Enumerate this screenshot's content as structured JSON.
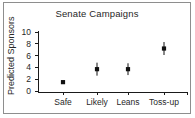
{
  "chart_data": {
    "type": "scatter",
    "title": "Senate Campaigns",
    "xlabel": "",
    "ylabel": "Predicted Sponsors",
    "categories": [
      "Safe",
      "Likely",
      "Leans",
      "Toss-up"
    ],
    "values": [
      1.5,
      3.7,
      3.7,
      7.2
    ],
    "error_low": [
      1.5,
      2.6,
      2.7,
      6.1
    ],
    "error_high": [
      1.5,
      4.8,
      4.7,
      8.3
    ],
    "ylim": [
      0,
      10
    ],
    "yticks": [
      0,
      2,
      4,
      6,
      8,
      10
    ],
    "ytick_labels": [
      "0",
      "2",
      "4",
      "6",
      "8",
      "10"
    ],
    "grid": false,
    "legend": "none",
    "marker_style": "square",
    "marker_color": "#111111",
    "errorbar_color": "#111111",
    "axis_color": "#1a1a1a",
    "background_color": "#ffffff",
    "border_color": "#8e8e8e"
  }
}
